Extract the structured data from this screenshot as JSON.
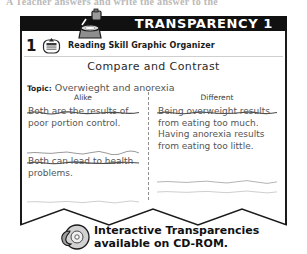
{
  "page": {
    "cut_off_top_text": "A Teacher answers and write the answer to the"
  },
  "titlebar": {
    "title": "TRANSPARENCY 1",
    "projector_icon": "overhead-projector-icon",
    "background_color": "#111111",
    "text_color": "#ffffff"
  },
  "header_row": {
    "number": "1",
    "badge_icon": "reading-skill-badge-icon",
    "label": "Reading Skill Graphic Organizer"
  },
  "worksheet": {
    "title": "Compare and Contrast",
    "topic_label": "Topic:",
    "topic_value": "Overwieght and anorexia",
    "columns": [
      {
        "heading": "Alike",
        "entries": [
          "Both are the results of poor portion control.",
          "Both can lead to health problems."
        ]
      },
      {
        "heading": "Different",
        "entries": [
          "Being overweight results from eating too much. Having anorexia results from eating too little."
        ]
      }
    ]
  },
  "footer": {
    "cd_icon": "cd-rom-disc-icon",
    "line1": "Interactive Transparencies",
    "line2": "available on CD-ROM."
  }
}
